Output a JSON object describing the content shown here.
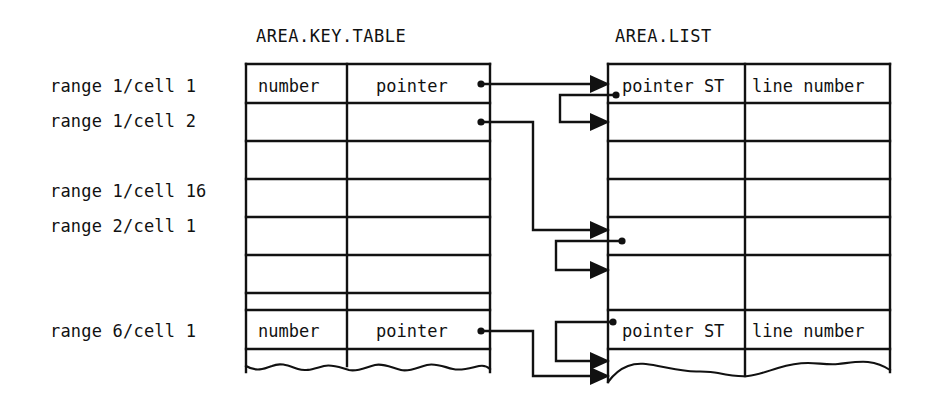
{
  "diagram": {
    "titles": {
      "key_table": "AREA.KEY.TABLE",
      "list_table": "AREA.LIST"
    },
    "row_labels": [
      {
        "id": "r1",
        "text": "range 1/cell 1",
        "row": 0
      },
      {
        "id": "r2",
        "text": "range 1/cell 2",
        "row": 1
      },
      {
        "id": "r3",
        "text": "range 1/cell 16",
        "row": 3
      },
      {
        "id": "r4",
        "text": "range 2/cell 1",
        "row": 4
      },
      {
        "id": "r5",
        "text": "range 6/cell 1",
        "row": 7
      }
    ],
    "key_table": {
      "name": "AREA.KEY.TABLE",
      "columns": [
        "number",
        "pointer"
      ],
      "row_count": 8,
      "cells": [
        {
          "row": 0,
          "number": "number",
          "pointer": "pointer"
        },
        {
          "row": 1,
          "number": "",
          "pointer": ""
        },
        {
          "row": 2,
          "number": "",
          "pointer": ""
        },
        {
          "row": 3,
          "number": "",
          "pointer": ""
        },
        {
          "row": 4,
          "number": "",
          "pointer": ""
        },
        {
          "row": 5,
          "number": "",
          "pointer": ""
        },
        {
          "row": 6,
          "number": "",
          "pointer": ""
        },
        {
          "row": 7,
          "number": "number",
          "pointer": "pointer"
        }
      ],
      "bottom_edge": "torn"
    },
    "list_table": {
      "name": "AREA.LIST",
      "columns": [
        "pointer ST",
        "line number"
      ],
      "row_count": 8,
      "cells": [
        {
          "row": 0,
          "pointer_st": "pointer ST",
          "line_number": "line number"
        },
        {
          "row": 1,
          "pointer_st": "",
          "line_number": ""
        },
        {
          "row": 2,
          "pointer_st": "",
          "line_number": ""
        },
        {
          "row": 3,
          "pointer_st": "",
          "line_number": ""
        },
        {
          "row": 4,
          "pointer_st": "",
          "line_number": ""
        },
        {
          "row": 5,
          "pointer_st": "",
          "line_number": ""
        },
        {
          "row": 6,
          "pointer_st": "pointer ST",
          "line_number": "line number"
        },
        {
          "row": 7,
          "pointer_st": "",
          "line_number": ""
        }
      ],
      "bottom_edge": "torn"
    },
    "connectors": [
      {
        "id": "c1",
        "from": "key_table.row0.pointer",
        "to": "list_table.row0",
        "kind": "arrow"
      },
      {
        "id": "c2",
        "from": "list_table.row0.pointer_st",
        "to": "list_table.row1",
        "kind": "arrow"
      },
      {
        "id": "c3",
        "from": "key_table.row1.pointer",
        "to": "list_table.row4",
        "kind": "arrow"
      },
      {
        "id": "c4",
        "from": "list_table.row4.pointer_st",
        "to": "list_table.row5",
        "kind": "arrow"
      },
      {
        "id": "c5",
        "from": "key_table.row7.pointer",
        "to": "list_table.row7",
        "kind": "arrow"
      },
      {
        "id": "c6",
        "from": "list_table.row6.pointer_st",
        "to": "list_table.row7b",
        "kind": "arrow"
      }
    ],
    "colors": {
      "ink": "#111111",
      "paper": "#ffffff"
    }
  }
}
